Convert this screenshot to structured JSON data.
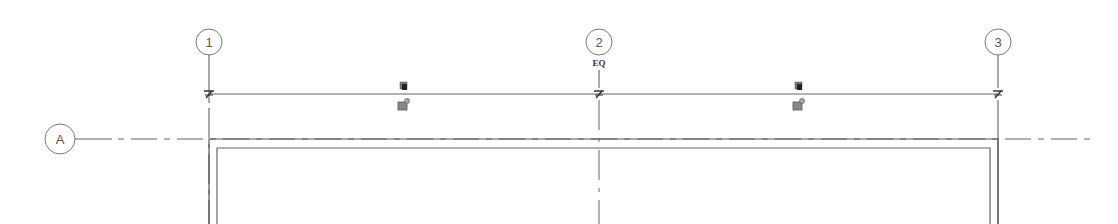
{
  "drawing": {
    "type": "floor-plan-grid",
    "background": "#ffffff",
    "line_color": "#6e6e6e",
    "grid_lines_vertical": [
      {
        "label": "1",
        "x": 209,
        "bubble_cy": 42
      },
      {
        "label": "2",
        "x": 599,
        "bubble_cy": 42
      },
      {
        "label": "3",
        "x": 998,
        "bubble_cy": 42
      }
    ],
    "grid_lines_horizontal": [
      {
        "label": "A",
        "y": 139,
        "bubble_cx": 60
      }
    ],
    "dimension": {
      "y": 94,
      "label": "EQ",
      "label_x": 599,
      "label_y": 66
    },
    "dimension_controls": [
      {
        "name": "lock-toggle-1",
        "x": 403
      },
      {
        "name": "lock-toggle-2",
        "x": 798
      }
    ],
    "walls": {
      "outer": {
        "left": 209,
        "right": 998,
        "top": 139
      },
      "inner": {
        "left": 217,
        "right": 990,
        "top": 148
      }
    }
  }
}
